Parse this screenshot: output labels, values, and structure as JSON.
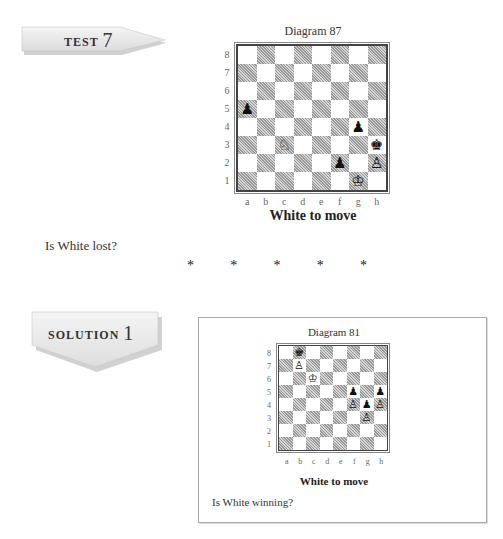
{
  "test_label": {
    "word": "TEST",
    "number": "7"
  },
  "diagram1": {
    "title": "Diagram 87",
    "ranks": [
      "8",
      "7",
      "6",
      "5",
      "4",
      "3",
      "2",
      "1"
    ],
    "files": [
      "a",
      "b",
      "c",
      "d",
      "e",
      "f",
      "g",
      "h"
    ],
    "pieces": [
      {
        "square": "a5",
        "color": "black",
        "type": "pawn",
        "glyph": "♟"
      },
      {
        "square": "g4",
        "color": "black",
        "type": "pawn",
        "glyph": "♟"
      },
      {
        "square": "c3",
        "color": "white",
        "type": "knight",
        "glyph": "♘"
      },
      {
        "square": "h3",
        "color": "black",
        "type": "king",
        "glyph": "♚"
      },
      {
        "square": "f2",
        "color": "black",
        "type": "pawn",
        "glyph": "♟"
      },
      {
        "square": "h2",
        "color": "white",
        "type": "pawn",
        "glyph": "♙"
      },
      {
        "square": "g1",
        "color": "white",
        "type": "king",
        "glyph": "♔"
      }
    ],
    "caption": "White to move"
  },
  "question1": "Is White lost?",
  "separator": [
    "*",
    "*",
    "*",
    "*",
    "*"
  ],
  "solution_label": {
    "word": "SOLUTION",
    "number": "1"
  },
  "diagram2": {
    "title": "Diagram 81",
    "ranks": [
      "8",
      "7",
      "6",
      "5",
      "4",
      "3",
      "2",
      "1"
    ],
    "files": [
      "a",
      "b",
      "c",
      "d",
      "e",
      "f",
      "g",
      "h"
    ],
    "pieces": [
      {
        "square": "b8",
        "color": "black",
        "type": "king",
        "glyph": "♚"
      },
      {
        "square": "b7",
        "color": "white",
        "type": "pawn",
        "glyph": "♙"
      },
      {
        "square": "c6",
        "color": "white",
        "type": "king",
        "glyph": "♔"
      },
      {
        "square": "f5",
        "color": "black",
        "type": "pawn",
        "glyph": "♟"
      },
      {
        "square": "h5",
        "color": "black",
        "type": "pawn",
        "glyph": "♟"
      },
      {
        "square": "f4",
        "color": "white",
        "type": "pawn",
        "glyph": "♙"
      },
      {
        "square": "g4",
        "color": "black",
        "type": "pawn",
        "glyph": "♟"
      },
      {
        "square": "h4",
        "color": "white",
        "type": "pawn",
        "glyph": "♙"
      },
      {
        "square": "g3",
        "color": "white",
        "type": "pawn",
        "glyph": "♙"
      }
    ],
    "caption": "White to move"
  },
  "question2": "Is White winning?"
}
